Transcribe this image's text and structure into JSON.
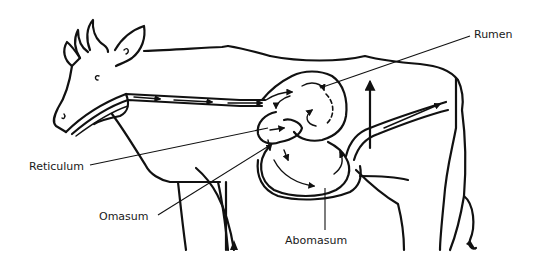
{
  "diagram": {
    "labels": {
      "rumen": "Rumen",
      "reticulum": "Reticulum",
      "omasum": "Omasum",
      "abomasum": "Abomasum"
    },
    "colors": {
      "ink": "#111111",
      "background": "#ffffff"
    },
    "icons": {
      "flow_arrows": "arrowhead-icon"
    }
  }
}
